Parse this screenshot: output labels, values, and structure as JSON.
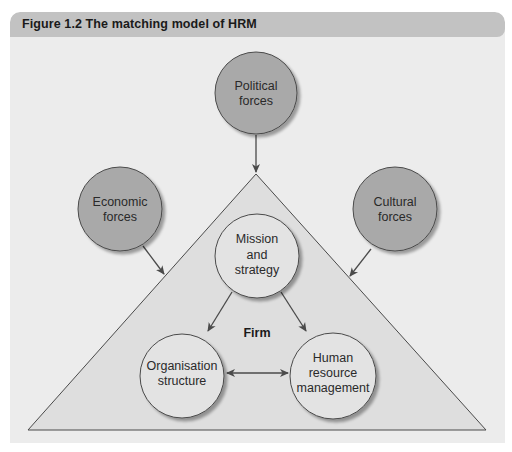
{
  "figure": {
    "title": "Figure 1.2  The matching model of HRM"
  },
  "colors": {
    "header_bg": "#c2c2c2",
    "panel_bg": "#ececec",
    "triangle_fill": "#dedede",
    "external_force_fill": "#a9a9a9",
    "internal_node_fill": "#e3e3e3",
    "stroke": "#4a4a4a"
  },
  "external_forces": [
    {
      "id": "political",
      "lines": [
        "Political",
        "forces"
      ]
    },
    {
      "id": "economic",
      "lines": [
        "Economic",
        "forces"
      ]
    },
    {
      "id": "cultural",
      "lines": [
        "Cultural",
        "forces"
      ]
    }
  ],
  "firm": {
    "label": "Firm",
    "nodes": [
      {
        "id": "mission",
        "lines": [
          "Mission",
          "and",
          "strategy"
        ]
      },
      {
        "id": "structure",
        "lines": [
          "Organisation",
          "structure"
        ]
      },
      {
        "id": "hrm",
        "lines": [
          "Human",
          "resource",
          "management"
        ]
      }
    ]
  }
}
